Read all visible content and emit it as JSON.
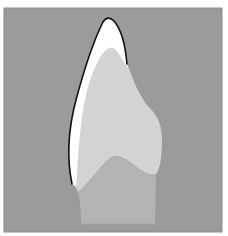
{
  "diagram": {
    "colors": {
      "page": "#ffffff",
      "background": "#9b9b9b",
      "enamel": "#ffffff",
      "dentin": "#d3d3d3",
      "pulp_root": "#b3b3b3",
      "outline": "#111111",
      "frame_edge": "#8a8a8a"
    },
    "regions": [
      "enamel",
      "dentin",
      "pulp-root"
    ]
  }
}
